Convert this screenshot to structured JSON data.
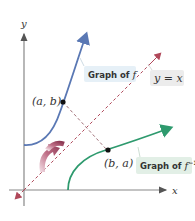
{
  "axes": {
    "x_label": "x",
    "y_label": "y"
  },
  "labels": {
    "point_f": "(a, b)",
    "point_finv": "(b, a)",
    "graph_f": "Graph of",
    "graph_f_var": "f",
    "graph_finv": "Graph of",
    "graph_finv_var": "f",
    "graph_finv_sup": "−1",
    "line": "y = x"
  },
  "colors": {
    "f_curve": "#5a78b4",
    "finv_curve": "#2e9a6e",
    "diagonal": "#b0485a",
    "perpendicular": "#a07078",
    "axis": "#888888",
    "label_box_f": "#e6f0f7",
    "label_box_finv": "#e2efe6",
    "label_box_line": "#ececec",
    "reflect_arrow": "#a84a62"
  }
}
